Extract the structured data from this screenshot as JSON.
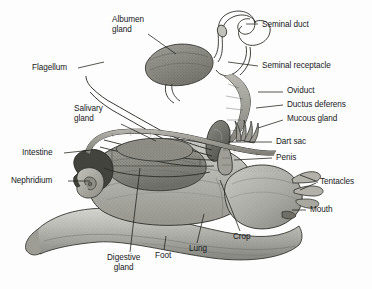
{
  "figure": {
    "style": "grayscale engraving / halftone scan",
    "background_color": "#fdfdfd",
    "ink_color": "#17181a",
    "body_fill": "#b9b9b6",
    "body_fill_dark": "#8d8d88",
    "body_fill_light": "#d8d8d4"
  },
  "labels": [
    {
      "id": "albumen-gland",
      "text": "Albumen\ngland",
      "x": 112,
      "y": 15,
      "align": "left",
      "lines": 2
    },
    {
      "id": "seminal-duct",
      "text": "Seminal duct",
      "x": 262,
      "y": 26,
      "align": "left",
      "lines": 1
    },
    {
      "id": "seminal-receptacle",
      "text": "Seminal receptacle",
      "x": 262,
      "y": 67,
      "align": "left",
      "lines": 1
    },
    {
      "id": "flagellum",
      "text": "Flagellum",
      "x": 32,
      "y": 65,
      "align": "left",
      "lines": 1
    },
    {
      "id": "oviduct",
      "text": "Oviduct",
      "x": 287,
      "y": 89,
      "align": "left",
      "lines": 1
    },
    {
      "id": "ductus-deferens",
      "text": "Ductus deferens",
      "x": 287,
      "y": 103,
      "align": "left",
      "lines": 1
    },
    {
      "id": "salivary-gland",
      "text": "Salivary\ngland",
      "x": 74,
      "y": 105,
      "align": "left",
      "lines": 2
    },
    {
      "id": "mucous-gland",
      "text": "Mucous gland",
      "x": 287,
      "y": 117,
      "align": "left",
      "lines": 1
    },
    {
      "id": "dart-sac",
      "text": "Dart sac",
      "x": 276,
      "y": 139,
      "align": "left",
      "lines": 1
    },
    {
      "id": "intestine",
      "text": "Intestine",
      "x": 22,
      "y": 150,
      "align": "left",
      "lines": 1
    },
    {
      "id": "penis",
      "text": "Penis",
      "x": 276,
      "y": 156,
      "align": "left",
      "lines": 1
    },
    {
      "id": "nephridium",
      "text": "Nephridium",
      "x": 11,
      "y": 178,
      "align": "left",
      "lines": 1
    },
    {
      "id": "tentacles",
      "text": "Tentacles",
      "x": 320,
      "y": 178,
      "align": "left",
      "lines": 1
    },
    {
      "id": "mouth",
      "text": "Mouth",
      "x": 310,
      "y": 207,
      "align": "left",
      "lines": 1
    },
    {
      "id": "crop",
      "text": "Crop",
      "x": 233,
      "y": 234,
      "align": "left",
      "lines": 1
    },
    {
      "id": "lung",
      "text": "Lung",
      "x": 189,
      "y": 246,
      "align": "left",
      "lines": 1
    },
    {
      "id": "foot",
      "text": "Foot",
      "x": 155,
      "y": 253,
      "align": "left",
      "lines": 1
    },
    {
      "id": "digestive-gland",
      "text": "Digestive\ngland",
      "x": 107,
      "y": 255,
      "align": "left",
      "lines": 2
    }
  ],
  "anatomy_parts": [
    "albumen gland",
    "seminal duct",
    "seminal receptacle",
    "flagellum",
    "oviduct",
    "ductus deferens",
    "salivary gland",
    "mucous gland",
    "dart sac",
    "intestine",
    "penis",
    "nephridium",
    "tentacles",
    "mouth",
    "crop",
    "lung",
    "foot",
    "digestive gland"
  ]
}
